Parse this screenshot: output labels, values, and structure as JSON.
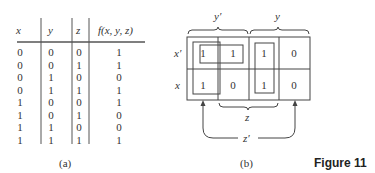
{
  "truth_table": {
    "headers": [
      "x",
      "y",
      "z",
      "f(x, y, z)"
    ],
    "rows": [
      [
        "0",
        "0",
        "0",
        "1"
      ],
      [
        "0",
        "0",
        "1",
        "1"
      ],
      [
        "0",
        "1",
        "0",
        "0"
      ],
      [
        "0",
        "1",
        "1",
        "1"
      ],
      [
        "1",
        "0",
        "0",
        "1"
      ],
      [
        "1",
        "0",
        "1",
        "0"
      ],
      [
        "1",
        "1",
        "0",
        "0"
      ],
      [
        "1",
        "1",
        "1",
        "1"
      ]
    ],
    "caption": "(a)"
  },
  "kmap": {
    "column_labels": {
      "y_prime": "y′",
      "y": "y",
      "z": "z",
      "z_prime": "z′"
    },
    "row_labels": [
      "x′",
      "x"
    ],
    "cells": [
      [
        "1",
        "1",
        "1",
        "0"
      ],
      [
        "1",
        "0",
        "1",
        "0"
      ]
    ],
    "caption": "(b)"
  },
  "figure_label": "Figure 11"
}
